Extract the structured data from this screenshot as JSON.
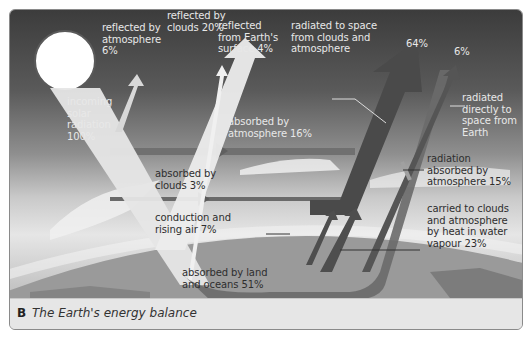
{
  "figure": {
    "caption_letter": "B",
    "caption_text": "The Earth's energy balance"
  },
  "labels": {
    "incoming": "incoming\nsolar\nradiation\n100%",
    "reflected_atmosphere": "reflected by\natmosphere\n6%",
    "reflected_clouds": "reflected by\nclouds 20%",
    "reflected_surface": "reflected\nfrom Earth's\nsurface 4%",
    "radiated_clouds_atmos": "radiated to space\nfrom clouds and\natmosphere",
    "pct_64": "64%",
    "pct_6": "6%",
    "radiated_direct": "radiated\ndirectly to\nspace from\nEarth",
    "absorbed_atmosphere": "absorbed by\natmosphere 16%",
    "absorbed_clouds": "absorbed by\nclouds 3%",
    "radiation_absorbed": "radiation\nabsorbed by\natmosphere 15%",
    "conduction": "conduction and\nrising air 7%",
    "water_vapour": "carried to clouds\nand atmosphere\nby heat in water\nvapour 23%",
    "absorbed_land": "absorbed by land\nand oceans 51%"
  },
  "energy_flows": [
    {
      "name": "incoming solar radiation",
      "percent": 100
    },
    {
      "name": "reflected by atmosphere",
      "percent": 6
    },
    {
      "name": "reflected by clouds",
      "percent": 20
    },
    {
      "name": "reflected from Earth's surface",
      "percent": 4
    },
    {
      "name": "absorbed by atmosphere",
      "percent": 16
    },
    {
      "name": "absorbed by clouds",
      "percent": 3
    },
    {
      "name": "absorbed by land and oceans",
      "percent": 51
    },
    {
      "name": "conduction and rising air",
      "percent": 7
    },
    {
      "name": "carried to clouds and atmosphere by heat in water vapour",
      "percent": 23
    },
    {
      "name": "radiation absorbed by atmosphere",
      "percent": 15
    },
    {
      "name": "radiated to space from clouds and atmosphere",
      "percent": 64
    },
    {
      "name": "radiated directly to space from Earth",
      "percent": 6
    }
  ]
}
